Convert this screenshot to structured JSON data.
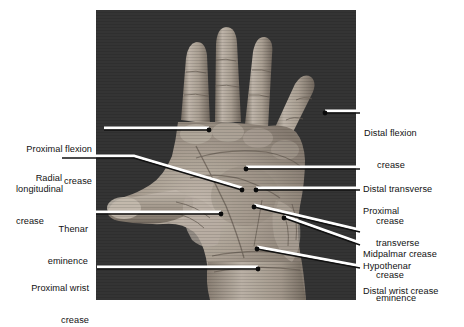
{
  "figure": {
    "photo": {
      "subject": "right hand, palmar (volar) surface, fingers abducted",
      "background_color": "#3c3c3c",
      "skin_tone_light": "#cfc6bb",
      "skin_tone_mid": "#9d9287",
      "skin_tone_shadow": "#6d6358",
      "frame": {
        "x": 96,
        "y": 10,
        "width": 260,
        "height": 290
      }
    },
    "leader_style": {
      "line_color": "#111111",
      "highlight_color": "#ffffff",
      "dot_color": "#0a0a0a"
    },
    "labels_left": [
      {
        "id": "proximal-flexion-crease",
        "lines": [
          "Proximal flexion",
          "crease"
        ],
        "text_x": 16,
        "text_y": 123,
        "leader": [
          [
            104,
            130
          ],
          [
            209,
            130
          ]
        ],
        "dot": [
          209,
          130
        ]
      },
      {
        "id": "radial-longitudinal-crease",
        "lines": [
          "Radial",
          "longitudinal",
          "crease"
        ],
        "text_x": 16,
        "text_y": 155,
        "leader": [
          [
            62,
            158
          ],
          [
            134,
            158
          ],
          [
            242,
            190
          ]
        ],
        "dot": [
          242,
          190
        ]
      },
      {
        "id": "thenar-eminence",
        "lines": [
          "Thenar",
          "eminence"
        ],
        "text_x": 22,
        "text_y": 203,
        "leader": [
          [
            96,
            214
          ],
          [
            221,
            214
          ]
        ],
        "dot": [
          221,
          214
        ]
      },
      {
        "id": "proximal-wrist-crease",
        "lines": [
          "Proximal wrist",
          "crease"
        ],
        "text_x": 16,
        "text_y": 262,
        "leader": [
          [
            97,
            269
          ],
          [
            258,
            269
          ]
        ],
        "dot": [
          258,
          269
        ]
      }
    ],
    "labels_right": [
      {
        "id": "distal-flexion-crease",
        "lines": [
          "Distal flexion",
          "crease"
        ],
        "text_x": 364,
        "text_y": 107,
        "leader": [
          [
            325,
            113
          ],
          [
            360,
            113
          ]
        ],
        "dot": [
          325,
          113
        ]
      },
      {
        "id": "distal-transverse-crease",
        "lines": [
          "Distal transverse",
          "crease"
        ],
        "text_x": 363,
        "text_y": 163,
        "leader": [
          [
            246,
            169
          ],
          [
            360,
            169
          ]
        ],
        "dot": [
          246,
          169
        ]
      },
      {
        "id": "proximal-transverse-crease",
        "lines": [
          "Proximal",
          "transverse",
          "crease"
        ],
        "text_x": 363,
        "text_y": 186,
        "leader": [
          [
            256,
            190
          ],
          [
            360,
            190
          ]
        ],
        "dot": [
          256,
          190
        ]
      },
      {
        "id": "midpalmar-crease",
        "lines": [
          "Midpalmar crease"
        ],
        "text_x": 363,
        "text_y": 228,
        "leader": [
          [
            254,
            207
          ],
          [
            360,
            232
          ]
        ],
        "dot": [
          254,
          207
        ]
      },
      {
        "id": "hypothenar-eminence",
        "lines": [
          "Hypothenar",
          "eminence"
        ],
        "text_x": 363,
        "text_y": 240,
        "leader": [
          [
            284,
            218
          ],
          [
            360,
            245
          ]
        ],
        "dot": [
          284,
          218
        ]
      },
      {
        "id": "distal-wrist-crease",
        "lines": [
          "Distal wrist crease"
        ],
        "text_x": 363,
        "text_y": 265,
        "leader": [
          [
            257,
            249
          ],
          [
            360,
            268
          ]
        ],
        "dot": [
          257,
          249
        ]
      }
    ]
  }
}
